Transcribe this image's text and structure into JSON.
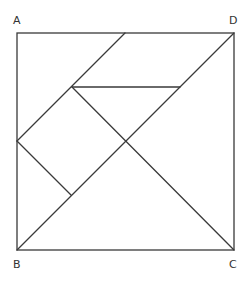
{
  "diagram": {
    "type": "tangram-square",
    "labels": {
      "A": "A",
      "B": "B",
      "C": "C",
      "D": "D"
    },
    "colors": {
      "stroke": "#3a3a3a",
      "label": "#333333",
      "background": "#ffffff"
    }
  }
}
